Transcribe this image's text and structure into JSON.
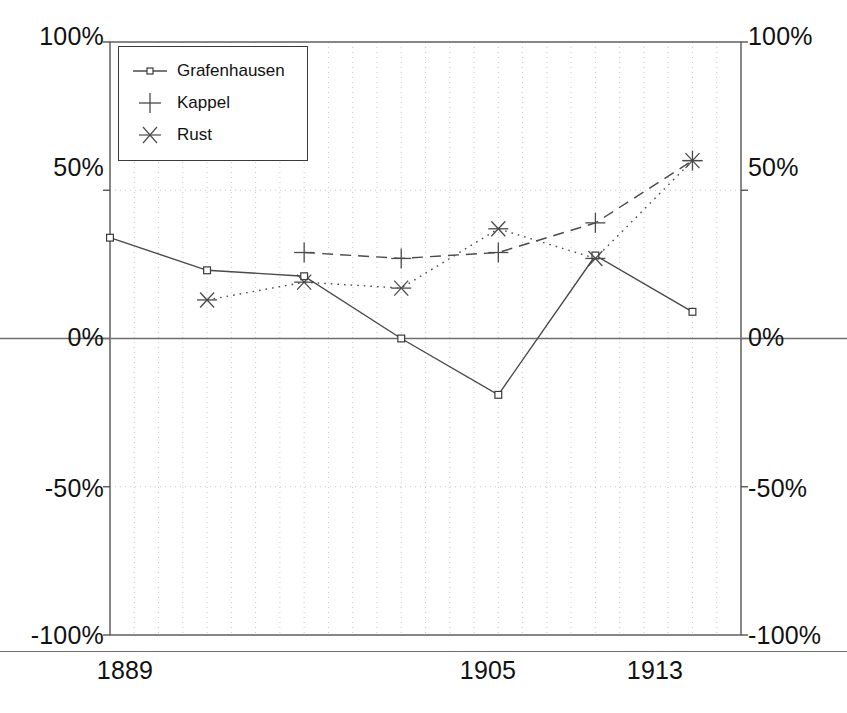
{
  "chart_data": {
    "type": "line",
    "title": "",
    "subtitle": "",
    "xlabel": "",
    "ylabel": "",
    "x": [
      1889,
      1893,
      1897,
      1901,
      1905,
      1909,
      1913
    ],
    "xlim": [
      1889,
      1915
    ],
    "ylim": [
      -100,
      100
    ],
    "y_unit": "%",
    "grid": true,
    "grid_style": "dotted",
    "legend_position": "top-left",
    "y_axis_dual": true,
    "series": [
      {
        "name": "Grafenhausen",
        "marker": "square-open",
        "line_style": "solid",
        "x": [
          1889,
          1893,
          1897,
          1901,
          1905,
          1909,
          1913
        ],
        "values": [
          34,
          23,
          21,
          0,
          -19,
          28,
          9
        ]
      },
      {
        "name": "Kappel",
        "marker": "plus",
        "line_style": "dashed",
        "x": [
          1897,
          1901,
          1905,
          1909,
          1913
        ],
        "values": [
          29,
          27,
          29,
          39,
          60
        ]
      },
      {
        "name": "Rust",
        "marker": "asterisk",
        "line_style": "dotted",
        "x": [
          1893,
          1897,
          1901,
          1905,
          1909,
          1913
        ],
        "values": [
          13,
          19,
          17,
          37,
          27,
          60
        ]
      }
    ],
    "axis_left_ticks": [
      {
        "value": 100,
        "label": "100%"
      },
      {
        "value": 50,
        "label": "50%"
      },
      {
        "value": 0,
        "label": "0%"
      },
      {
        "value": -50,
        "label": "-50%"
      },
      {
        "value": -100,
        "label": "-100%"
      }
    ],
    "axis_right_ticks": [
      {
        "value": 100,
        "label": "100%"
      },
      {
        "value": 50,
        "label": "50%"
      },
      {
        "value": 0,
        "label": "0%"
      },
      {
        "value": -50,
        "label": "-50%"
      },
      {
        "value": -100,
        "label": "-100%"
      }
    ],
    "axis_x_ticks": [
      {
        "value": 1889,
        "label": "1889"
      },
      {
        "value": 1905,
        "label": "1905"
      },
      {
        "value": 1913,
        "label": "1913"
      }
    ]
  },
  "legend": {
    "items": [
      {
        "label": "Grafenhausen",
        "symbol": "line-square-marker"
      },
      {
        "label": "Kappel",
        "symbol": "plus-marker"
      },
      {
        "label": "Rust",
        "symbol": "asterisk-marker"
      }
    ]
  },
  "colors": {
    "line": "#4a4a4a",
    "grid": "#c9c9c9",
    "axis": "#555555",
    "text": "#111111",
    "background": "#ffffff"
  }
}
